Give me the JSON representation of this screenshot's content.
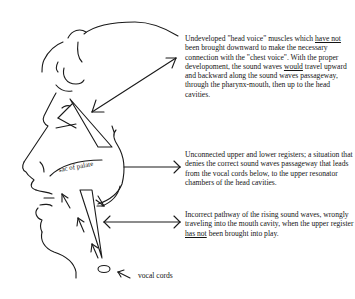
{
  "diagram": {
    "type": "vocal anatomy illustration",
    "labels": {
      "sac_of_palate": "sac of palate",
      "vocal_cords": "vocal cords"
    },
    "annotations": [
      {
        "id": "head_voice",
        "parts": [
          "Undeveloped \"head voice\" muscles which ",
          "have not",
          " been brought downward to make the necessary connection with the \"chest voice\". With the proper developoment, the sound waves ",
          "would",
          " travel upward and backward along the sound waves passageway,  through the pharynx-mouth, then up to the head cavities."
        ]
      },
      {
        "id": "unconnected_registers",
        "parts": [
          "Unconnected upper and lower registers; a situation that denies the correct sound waves passageway that leads from the vocal cords below, to the upper resonator chambers of the head cavities."
        ]
      },
      {
        "id": "incorrect_pathway",
        "parts": [
          "Incorrect pathway of the rising sound waves, wrongly traveling into the mouth cavity, when the upper register ",
          "has not",
          " been brought into play."
        ]
      }
    ],
    "line_color": "#1a1a1a",
    "background": "#ffffff"
  }
}
